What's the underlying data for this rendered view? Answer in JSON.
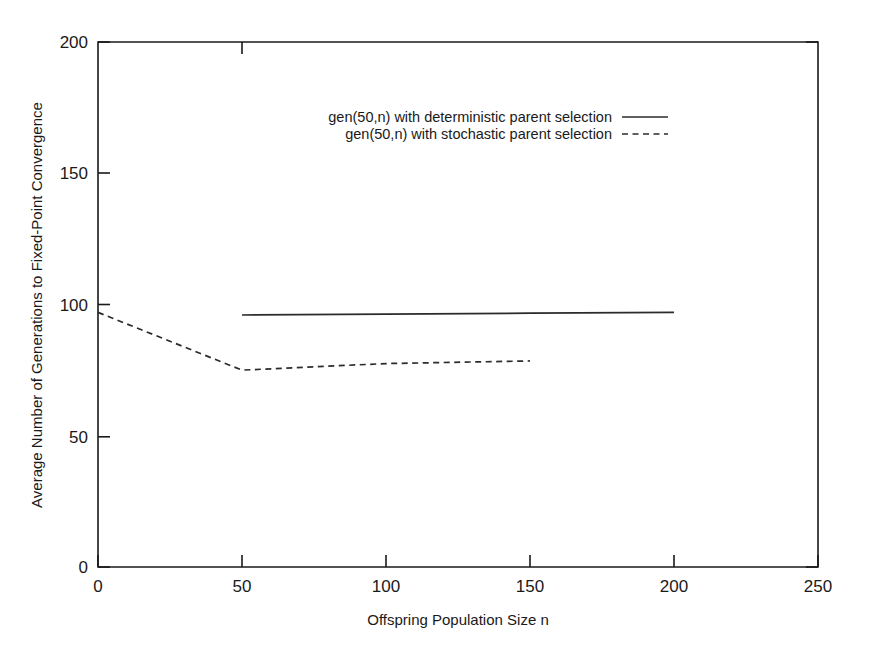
{
  "chart_data": {
    "type": "line",
    "title": "",
    "xlabel": "Offspring Population Size n",
    "ylabel": "Average Number of Generations to Fixed-Point Convergence",
    "xlim": [
      0,
      250
    ],
    "ylim": [
      0,
      200
    ],
    "xticks": [
      0,
      50,
      100,
      150,
      200,
      250
    ],
    "yticks": [
      0,
      50,
      100,
      150,
      200
    ],
    "xtick_labels": [
      "0",
      "50",
      "100",
      "150",
      "200",
      "250"
    ],
    "ytick_labels": [
      "0",
      "50",
      "100",
      "150",
      "200"
    ],
    "grid": false,
    "legend_position": "upper-center",
    "series": [
      {
        "name": "gen(50,n) with deterministic parent selection",
        "style": "solid",
        "color": "#2b2b2b",
        "x": [
          50,
          100,
          150,
          200
        ],
        "y": [
          96,
          96.3,
          96.7,
          97
        ]
      },
      {
        "name": "gen(50,n) with stochastic parent selection",
        "style": "dashed",
        "color": "#2b2b2b",
        "x": [
          0,
          50,
          100,
          150
        ],
        "y": [
          97,
          75,
          77.5,
          78.5
        ]
      }
    ]
  },
  "legend": {
    "entries": [
      {
        "label": "gen(50,n) with deterministic parent selection",
        "style": "solid"
      },
      {
        "label": "gen(50,n) with stochastic parent selection",
        "style": "dashed"
      }
    ]
  },
  "axes": {
    "x_title": "Offspring Population Size n",
    "y_title": "Average Number of Generations to Fixed-Point Convergence",
    "x_labels": [
      "0",
      "50",
      "100",
      "150",
      "200",
      "250"
    ],
    "y_labels": [
      "0",
      "50",
      "100",
      "150",
      "200"
    ]
  }
}
